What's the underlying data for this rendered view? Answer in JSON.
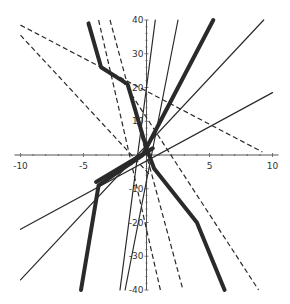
{
  "chart_data": {
    "type": "line",
    "title": "",
    "xlabel": "",
    "ylabel": "",
    "xlim": [
      -10,
      10
    ],
    "ylim": [
      -40,
      40
    ],
    "grid": false,
    "legend": null,
    "x_ticks": [
      -10,
      -5,
      5,
      10
    ],
    "y_ticks": [
      40,
      30,
      20,
      10,
      -10,
      -20,
      -30,
      -40
    ],
    "x_tick_labels": [
      "-10",
      "-5",
      "5",
      "10"
    ],
    "y_tick_labels": [
      "40",
      "30",
      "20",
      "10",
      "-10",
      "-20",
      "-30",
      "-40"
    ],
    "series": [
      {
        "name": "dashed-1",
        "style": "dashed",
        "weight": "thin",
        "points": [
          [
            -10,
            38.5
          ],
          [
            9.2,
            0.9
          ]
        ]
      },
      {
        "name": "dashed-2",
        "style": "dashed",
        "weight": "thin",
        "points": [
          [
            -10,
            35.5
          ],
          [
            0.3,
            -6
          ]
        ]
      },
      {
        "name": "dashed-3",
        "style": "dashed",
        "weight": "thin",
        "points": [
          [
            -3.8,
            40
          ],
          [
            1.1,
            -40
          ]
        ]
      },
      {
        "name": "dashed-4",
        "style": "dashed",
        "weight": "thin",
        "points": [
          [
            -2.9,
            40
          ],
          [
            2.9,
            -40
          ]
        ]
      },
      {
        "name": "dashed-5",
        "style": "dashed",
        "weight": "thin",
        "points": [
          [
            -1.9,
            22
          ],
          [
            8.9,
            -40
          ]
        ]
      },
      {
        "name": "solid-1",
        "style": "solid",
        "weight": "thin",
        "points": [
          [
            -10,
            -22
          ],
          [
            10,
            18.5
          ]
        ]
      },
      {
        "name": "solid-2",
        "style": "solid",
        "weight": "thin",
        "points": [
          [
            -10,
            -37
          ],
          [
            9.3,
            40
          ]
        ]
      },
      {
        "name": "solid-3",
        "style": "solid",
        "weight": "thin",
        "points": [
          [
            -2.1,
            -40
          ],
          [
            0.7,
            40
          ]
        ]
      },
      {
        "name": "solid-4",
        "style": "solid",
        "weight": "thin",
        "points": [
          [
            -1.7,
            -40
          ],
          [
            2.5,
            40
          ]
        ]
      },
      {
        "name": "thick-piecewise-1",
        "style": "solid",
        "weight": "thick",
        "points": [
          [
            -4.6,
            39
          ],
          [
            -3.6,
            26
          ],
          [
            -1.5,
            21
          ],
          [
            0,
            2
          ],
          [
            0.6,
            -4
          ],
          [
            4,
            -20
          ],
          [
            6.2,
            -40
          ]
        ]
      },
      {
        "name": "thick-2",
        "style": "solid",
        "weight": "thick",
        "points": [
          [
            -5.2,
            -40
          ],
          [
            -3.8,
            -9
          ],
          [
            -0.3,
            0
          ],
          [
            5.3,
            40
          ]
        ]
      },
      {
        "name": "thick-3",
        "style": "solid",
        "weight": "thick",
        "points": [
          [
            -4.0,
            -8
          ],
          [
            0.5,
            2
          ]
        ]
      }
    ]
  }
}
